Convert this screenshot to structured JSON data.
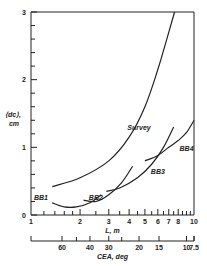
{
  "chart_data": {
    "type": "line",
    "title": "",
    "ylabel": "⟨d_c⟩, cm",
    "ylabel_line1": "⟨dc⟩,",
    "ylabel_line2": "cm",
    "xlabel": "L, m",
    "x_scale": "log",
    "xlim": [
      1,
      10
    ],
    "ylim": [
      0,
      3
    ],
    "x_ticks": [
      1,
      2,
      3,
      4,
      5,
      6,
      7,
      8,
      10
    ],
    "x_tick_labels": [
      "1",
      "2",
      "3",
      "4",
      "5",
      "6",
      "7",
      "8",
      "10"
    ],
    "y_ticks": [
      0,
      1,
      2,
      3
    ],
    "y_tick_labels": [
      "0",
      "1",
      "2",
      "3"
    ],
    "secondary_xlabel": "CEA, deg",
    "secondary_x_ticks": [
      {
        "label": "60",
        "L": 1.55
      },
      {
        "label": "40",
        "L": 2.3
      },
      {
        "label": "30",
        "L": 3.0
      },
      {
        "label": "20",
        "L": 4.6
      },
      {
        "label": "15",
        "L": 6.1
      },
      {
        "label": "10",
        "L": 9.0
      },
      {
        "label": "7.5",
        "L": 12.0
      }
    ],
    "grid": false,
    "series": [
      {
        "name": "Survey",
        "x": [
          1.35,
          2.0,
          3.0,
          4.0,
          5.0,
          6.0,
          7.0,
          7.6
        ],
        "y": [
          0.42,
          0.55,
          0.8,
          1.15,
          1.6,
          2.15,
          2.7,
          3.0
        ]
      },
      {
        "name": "BB1",
        "x": [
          1.35,
          1.6,
          1.9,
          2.3,
          2.7
        ],
        "y": [
          0.18,
          0.12,
          0.12,
          0.18,
          0.3
        ]
      },
      {
        "name": "BB2",
        "x": [
          2.1,
          2.5,
          3.0,
          3.6,
          4.2
        ],
        "y": [
          0.22,
          0.2,
          0.3,
          0.48,
          0.72
        ]
      },
      {
        "name": "BB3",
        "x": [
          2.9,
          3.5,
          4.5,
          5.5,
          6.5,
          7.5
        ],
        "y": [
          0.35,
          0.4,
          0.55,
          0.75,
          1.0,
          1.3
        ]
      },
      {
        "name": "BB4",
        "x": [
          5.0,
          6.0,
          7.0,
          8.0,
          9.0,
          10.0
        ],
        "y": [
          0.8,
          0.88,
          1.0,
          1.1,
          1.22,
          1.4
        ]
      }
    ],
    "annotations": [
      {
        "text": "Survey",
        "x": 4.6,
        "y": 1.25
      },
      {
        "text": "BB1",
        "x": 1.15,
        "y": 0.22
      },
      {
        "text": "BB2",
        "x": 2.5,
        "y": 0.22
      },
      {
        "text": "BB3",
        "x": 6.0,
        "y": 0.6
      },
      {
        "text": "BB4",
        "x": 9.0,
        "y": 0.95
      }
    ]
  }
}
